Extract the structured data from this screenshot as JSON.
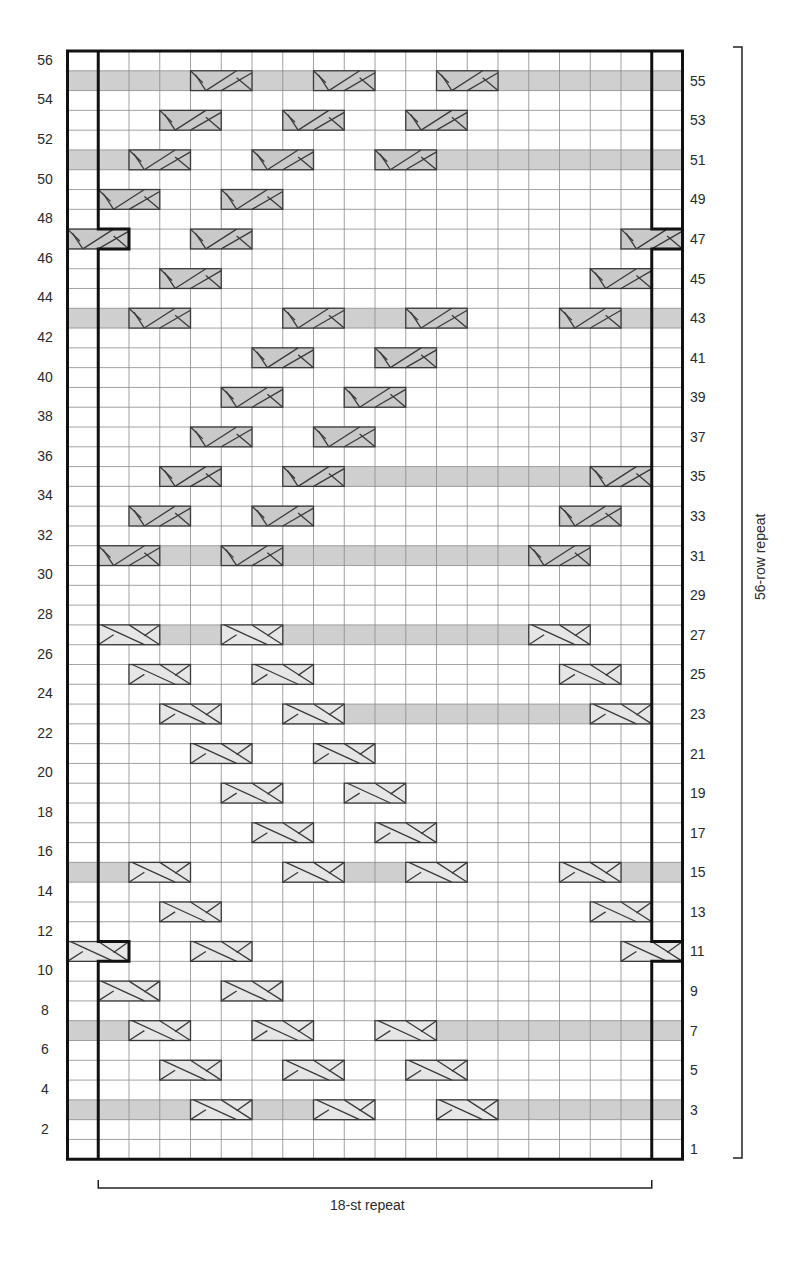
{
  "chart": {
    "columns": 20,
    "rows": 56,
    "repeat_columns": [
      1,
      18
    ],
    "colors": {
      "grid_line": "#8a8a8a",
      "border": "#111111",
      "shade": "#cfcfcf",
      "cable_dark_fill": "#c9c9c9",
      "cable_light_fill": "#e6e6e6",
      "cable_stroke": "#3a3a3a",
      "background": "#ffffff"
    },
    "left_labels": [
      "2",
      "4",
      "6",
      "8",
      "10",
      "12",
      "14",
      "16",
      "18",
      "20",
      "22",
      "24",
      "26",
      "28",
      "30",
      "32",
      "34",
      "36",
      "38",
      "40",
      "42",
      "44",
      "46",
      "48",
      "50",
      "52",
      "54",
      "56"
    ],
    "right_labels": [
      "1",
      "3",
      "5",
      "7",
      "9",
      "11",
      "13",
      "15",
      "17",
      "19",
      "21",
      "23",
      "25",
      "27",
      "29",
      "31",
      "33",
      "35",
      "37",
      "39",
      "41",
      "43",
      "45",
      "47",
      "49",
      "51",
      "53",
      "55"
    ],
    "horizontal_repeat_label": "18-st repeat",
    "vertical_repeat_label": "56-row repeat",
    "pattern_rows": [
      {
        "row": 55,
        "cable": "left-cross",
        "shade": [
          [
            0,
            3
          ],
          [
            6,
            7
          ],
          [
            14,
            19
          ]
        ],
        "cables": [
          4,
          8,
          12
        ]
      },
      {
        "row": 53,
        "cable": "left-cross",
        "shade": [],
        "cables": [
          3,
          7,
          11
        ]
      },
      {
        "row": 51,
        "cable": "left-cross",
        "shade": [
          [
            0,
            1
          ],
          [
            12,
            19
          ]
        ],
        "cables": [
          2,
          6,
          10
        ]
      },
      {
        "row": 49,
        "cable": "left-cross",
        "shade": [],
        "cables": [
          1,
          5
        ]
      },
      {
        "row": 47,
        "cable": "left-cross",
        "shade": [],
        "cables": [
          0,
          4,
          18
        ],
        "notch": true
      },
      {
        "row": 45,
        "cable": "left-cross",
        "shade": [],
        "cables": [
          3,
          17
        ]
      },
      {
        "row": 43,
        "cable": "left-cross",
        "shade": [
          [
            0,
            1
          ],
          [
            9,
            10
          ],
          [
            18,
            19
          ]
        ],
        "cables": [
          2,
          7,
          11,
          16
        ]
      },
      {
        "row": 41,
        "cable": "left-cross",
        "shade": [],
        "cables": [
          6,
          10
        ]
      },
      {
        "row": 39,
        "cable": "left-cross",
        "shade": [],
        "cables": [
          5,
          9
        ]
      },
      {
        "row": 37,
        "cable": "left-cross",
        "shade": [],
        "cables": [
          4,
          8
        ]
      },
      {
        "row": 35,
        "cable": "left-cross",
        "shade": [
          [
            9,
            16
          ]
        ],
        "cables": [
          3,
          7,
          17
        ]
      },
      {
        "row": 33,
        "cable": "left-cross",
        "shade": [],
        "cables": [
          2,
          6,
          16
        ]
      },
      {
        "row": 31,
        "cable": "left-cross",
        "shade": [
          [
            3,
            4
          ],
          [
            7,
            14
          ]
        ],
        "cables": [
          1,
          5,
          15
        ]
      },
      {
        "row": 29,
        "cable": "right-cross",
        "shade": [],
        "cables": []
      },
      {
        "row": 27,
        "cable": "right-cross",
        "shade": [
          [
            3,
            4
          ],
          [
            7,
            14
          ]
        ],
        "cables": [
          1,
          5,
          15
        ]
      },
      {
        "row": 25,
        "cable": "right-cross",
        "shade": [],
        "cables": [
          2,
          6,
          16
        ]
      },
      {
        "row": 23,
        "cable": "right-cross",
        "shade": [
          [
            9,
            16
          ]
        ],
        "cables": [
          3,
          7,
          17
        ]
      },
      {
        "row": 21,
        "cable": "right-cross",
        "shade": [],
        "cables": [
          4,
          8
        ]
      },
      {
        "row": 19,
        "cable": "right-cross",
        "shade": [],
        "cables": [
          5,
          9
        ]
      },
      {
        "row": 17,
        "cable": "right-cross",
        "shade": [],
        "cables": [
          6,
          10
        ]
      },
      {
        "row": 15,
        "cable": "right-cross",
        "shade": [
          [
            0,
            1
          ],
          [
            9,
            10
          ],
          [
            18,
            19
          ]
        ],
        "cables": [
          2,
          7,
          11,
          16
        ]
      },
      {
        "row": 13,
        "cable": "right-cross",
        "shade": [],
        "cables": [
          3,
          17
        ]
      },
      {
        "row": 11,
        "cable": "right-cross",
        "shade": [],
        "cables": [
          0,
          4,
          18
        ],
        "notch": true
      },
      {
        "row": 9,
        "cable": "right-cross",
        "shade": [],
        "cables": [
          1,
          5
        ]
      },
      {
        "row": 7,
        "cable": "right-cross",
        "shade": [
          [
            0,
            1
          ],
          [
            12,
            19
          ]
        ],
        "cables": [
          2,
          6,
          10
        ]
      },
      {
        "row": 5,
        "cable": "right-cross",
        "shade": [],
        "cables": [
          3,
          7,
          11
        ]
      },
      {
        "row": 3,
        "cable": "right-cross",
        "shade": [
          [
            0,
            3
          ],
          [
            6,
            7
          ],
          [
            14,
            19
          ]
        ],
        "cables": [
          4,
          8,
          12
        ]
      }
    ]
  }
}
